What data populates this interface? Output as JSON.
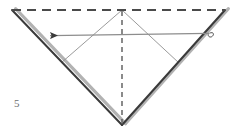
{
  "figure": {
    "step_number": "5",
    "caption": "",
    "type": "origami-fold-diagram",
    "canvas": {
      "width": 239,
      "height": 134,
      "background": "#ffffff"
    }
  },
  "colors": {
    "edge_dark": "#3a3a3a",
    "edge_shadow": "#a8a8a8",
    "crease_dashed": "#4a4a4a",
    "crease_thin": "#8c8c8c",
    "arrow": "#8a8a8a",
    "arrow_head": "#3a3a3a",
    "number_text": "#6d6d6d"
  },
  "geometry": {
    "top_left": {
      "x": 12,
      "y": 10
    },
    "top_center": {
      "x": 122,
      "y": 10
    },
    "top_right": {
      "x": 225,
      "y": 10
    },
    "bottom_vertex": {
      "x": 122,
      "y": 125
    },
    "inner_left_end": {
      "x": 62,
      "y": 62
    },
    "inner_right_end": {
      "x": 178,
      "y": 62
    }
  },
  "elements": {
    "top_dashed_edge": {
      "label": "top horizontal valley crease",
      "style": "dashed",
      "from": {
        "x": 12,
        "y": 10
      },
      "to": {
        "x": 225,
        "y": 10
      }
    },
    "center_dashed_crease": {
      "label": "vertical center crease",
      "style": "dashed",
      "from": {
        "x": 122,
        "y": 10
      },
      "to": {
        "x": 122,
        "y": 125
      }
    },
    "left_edge": {
      "label": "left outer folded edge",
      "style": "solid-thick-double",
      "from": {
        "x": 12,
        "y": 10
      },
      "to": {
        "x": 122,
        "y": 125
      }
    },
    "right_edge": {
      "label": "right outer folded edge",
      "style": "solid-thick-double",
      "from": {
        "x": 225,
        "y": 10
      },
      "to": {
        "x": 122,
        "y": 125
      }
    },
    "inner_left_crease": {
      "label": "inner crease from apex to left edge",
      "style": "solid-thin",
      "from": {
        "x": 122,
        "y": 10
      },
      "to": {
        "x": 62,
        "y": 62
      }
    },
    "inner_right_crease": {
      "label": "inner crease from apex to right edge",
      "style": "solid-thin",
      "from": {
        "x": 122,
        "y": 10
      },
      "to": {
        "x": 178,
        "y": 62
      }
    },
    "fold_arrow": {
      "label": "fold arrow pointing left",
      "direction": "left",
      "tail": {
        "x": 211,
        "y": 33
      },
      "head": {
        "x": 47,
        "y": 36
      },
      "has_tail_loop": true,
      "loop_center": {
        "x": 207,
        "y": 33
      }
    }
  },
  "legend": {
    "dashed_meaning": "valley / existing crease line",
    "solid_meaning": "paper edge",
    "arrow_meaning": "fold this flap toward the left"
  }
}
